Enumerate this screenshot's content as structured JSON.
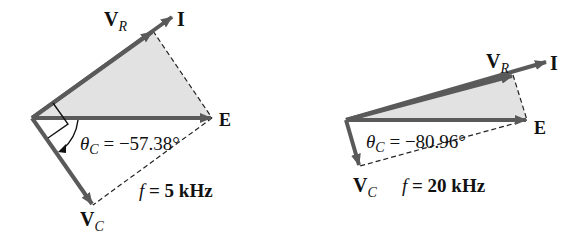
{
  "colors": {
    "arrow": "#5a5a5a",
    "fill": "#e2e2e2",
    "dash": "#222222",
    "text": "#111111"
  },
  "diagrams": [
    {
      "name": "phasor-5khz",
      "labels": {
        "vr": "V",
        "vr_sub": "R",
        "i": "I",
        "e": "E",
        "vc": "V",
        "vc_sub": "C",
        "theta": "θ",
        "theta_sub": "C",
        "theta_value": " = −57.38°",
        "f": "f",
        "f_value": " =  5 kHz"
      }
    },
    {
      "name": "phasor-20khz",
      "labels": {
        "vr": "V",
        "vr_sub": "R",
        "i": "I",
        "e": "E",
        "vc": "V",
        "vc_sub": "C",
        "theta": "θ",
        "theta_sub": "C",
        "theta_value": " = −80.96°",
        "f": "f",
        "f_value": " =  20 kHz"
      }
    }
  ]
}
